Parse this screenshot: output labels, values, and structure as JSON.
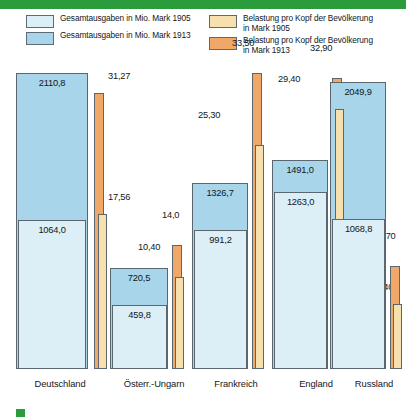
{
  "legend": {
    "items": [
      {
        "label": "Gesamtausgaben in Mio. Mark 1905",
        "color": "#dceef6",
        "name": "legend-total-1905"
      },
      {
        "label": "Gesamtausgaben in Mio. Mark 1913",
        "color": "#a8d5ea",
        "name": "legend-total-1913"
      },
      {
        "label": "Belastung pro Kopf der Bevölkerung\nin Mark 1905",
        "color": "#f7dfae",
        "name": "legend-percap-1905"
      },
      {
        "label": "Belastung pro Kopf der Bevölkerung\nin Mark 1913",
        "color": "#f0a868",
        "name": "legend-percap-1913"
      }
    ]
  },
  "colors": {
    "total_1905": "#dceef6",
    "total_1913": "#a8d5ea",
    "percap_1905": "#f7dfae",
    "percap_1913": "#f0a868",
    "outline": "#5a6670",
    "rule_green": "#2a9c3c"
  },
  "chart_data": {
    "type": "bar",
    "title": "",
    "xlabel": "",
    "ylabel": "",
    "grid": false,
    "legend_position": "top",
    "categories": [
      "Deutschland",
      "Österr.-Ungarn",
      "Frankreich",
      "England",
      "Russland"
    ],
    "series": [
      {
        "name": "Gesamtausgaben in Mio. Mark 1905",
        "unit": "Mio. Mark",
        "values": [
          1064.0,
          459.8,
          991.2,
          1263.0,
          1068.8
        ],
        "labels": [
          "1064,0",
          "459,8",
          "991,2",
          "1263,0",
          "1068,8"
        ]
      },
      {
        "name": "Gesamtausgaben in Mio. Mark 1913",
        "unit": "Mio. Mark",
        "values": [
          2110.8,
          720.5,
          1326.7,
          1491.0,
          2049.9
        ],
        "labels": [
          "2110,8",
          "720,5",
          "1326,7",
          "1491,0",
          "2049,9"
        ]
      },
      {
        "name": "Belastung pro Kopf der Bevölkerung in Mark 1905",
        "unit": "Mark",
        "values": [
          17.56,
          10.4,
          25.3,
          29.4,
          7.4
        ],
        "labels": [
          "17,56",
          "10,40",
          "25,30",
          "29,40",
          "7,40"
        ]
      },
      {
        "name": "Belastung pro Kopf der Bevölkerung in Mark 1913",
        "unit": "Mark",
        "values": [
          31.27,
          14.0,
          33.5,
          32.9,
          11.7
        ],
        "labels": [
          "31,27",
          "14,0",
          "33,50",
          "32,90",
          "11,70"
        ]
      }
    ]
  }
}
